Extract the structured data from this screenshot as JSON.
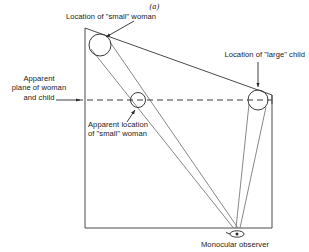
{
  "figure": {
    "panel_letter": "(a)",
    "caption_labels": {
      "small_woman_location": "Location of \"small\" woman",
      "large_child_location": "Location of \"large\" child",
      "apparent_plane": "Apparent\nplane of woman\nand child",
      "apparent_plane_line1": "Apparent",
      "apparent_plane_line2": "plane of woman",
      "apparent_plane_line3": "and child",
      "apparent_small_woman_line1": "Apparent location",
      "apparent_small_woman_line2": "of \"small\" woman",
      "monocular_observer": "Monocular observer"
    },
    "colors": {
      "stroke": "#3a3a3a",
      "text": "#1a1a1a",
      "background": "#ffffff"
    },
    "geometry": {
      "room_box": {
        "left": 85,
        "top": 28,
        "right": 272,
        "bottom": 228
      },
      "observer_point": {
        "x": 237,
        "y": 228
      },
      "woman_circle": {
        "cx": 100,
        "cy": 45,
        "r": 11
      },
      "child_circle": {
        "cx": 258,
        "cy": 100,
        "r": 10
      },
      "apparent_woman_circle": {
        "cx": 138,
        "cy": 100,
        "r": 7.5
      },
      "apparent_plane_line_y": 100
    },
    "elements": {
      "eye_symbol": "monocular-eye",
      "dashed_line": "apparent-plane-dashed-line",
      "ceiling_line": "slanted-ceiling-line"
    }
  }
}
